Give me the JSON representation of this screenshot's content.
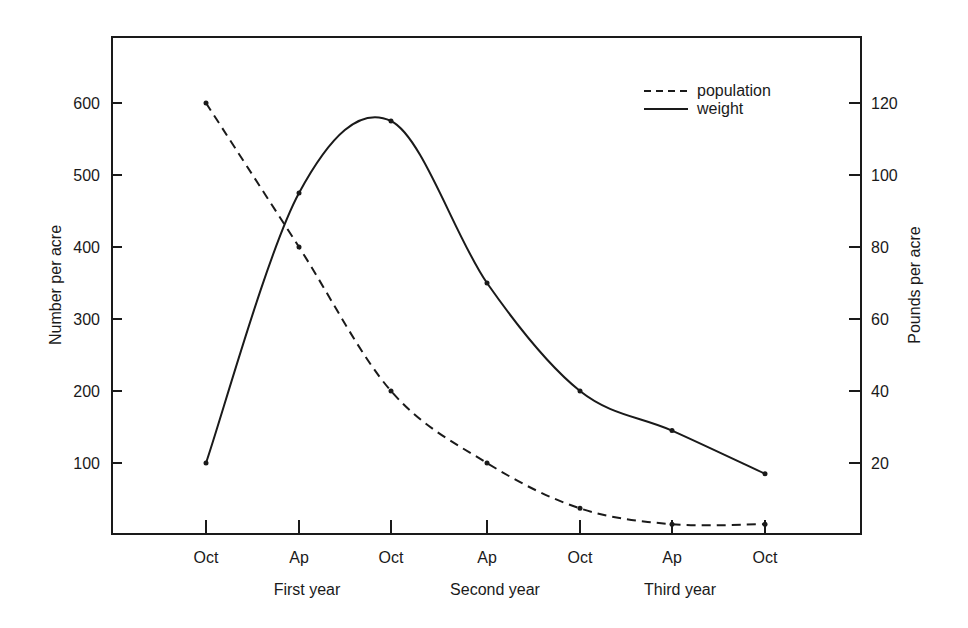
{
  "chart_data": {
    "type": "line",
    "title": "",
    "categories": [
      "Oct",
      "Ap",
      "Oct",
      "Ap",
      "Oct",
      "Ap",
      "Oct"
    ],
    "year_groups": [
      {
        "label": "First year",
        "center_index": 1
      },
      {
        "label": "Second year",
        "center_index": 3
      },
      {
        "label": "Third year",
        "center_index": 5
      }
    ],
    "xlabel": "",
    "ylabel": "Number per acre",
    "ylabel_right": "Pounds per acre",
    "ylim": [
      0,
      700
    ],
    "ylim_right": [
      0,
      140
    ],
    "yticks_left": [
      100,
      200,
      300,
      400,
      500,
      600
    ],
    "yticks_right": [
      20,
      40,
      60,
      80,
      100,
      120
    ],
    "grid": false,
    "legend_position": "upper right",
    "series": [
      {
        "name": "population",
        "axis": "left",
        "style": "dashed",
        "values": [
          600,
          400,
          200,
          100,
          37,
          15,
          15
        ]
      },
      {
        "name": "weight",
        "axis": "right",
        "style": "solid",
        "values": [
          20,
          95,
          115,
          70,
          40,
          29,
          17
        ]
      }
    ]
  },
  "legend": {
    "items": [
      {
        "label": "population",
        "style": "dashed"
      },
      {
        "label": "weight",
        "style": "solid"
      }
    ]
  },
  "colors": {
    "ink": "#1a1a1a",
    "background": "#ffffff"
  }
}
